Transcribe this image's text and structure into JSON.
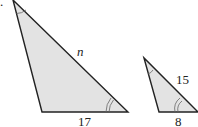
{
  "diagram": {
    "problem_marker": ".",
    "colors": {
      "fill": "#e3e3e3",
      "stroke": "#222222",
      "arc": "#666666"
    },
    "large_triangle": {
      "label_hypotenuse": "n",
      "label_base": "17"
    },
    "small_triangle": {
      "label_hypotenuse": "15",
      "label_base": "8"
    }
  }
}
